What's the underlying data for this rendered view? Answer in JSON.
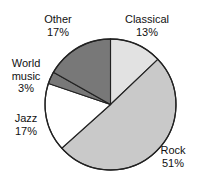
{
  "chart_data": {
    "type": "pie",
    "title": "",
    "subtitle": "",
    "xlabel": "",
    "ylabel": "",
    "legend_position": "none",
    "grid": false,
    "start_angle_deg": 0,
    "direction": "clockwise",
    "categories": [
      "Classical",
      "Rock",
      "Jazz",
      "World music",
      "Other"
    ],
    "values": [
      13,
      51,
      17,
      3,
      17
    ],
    "unit": "%",
    "colors": [
      "#e2e2e2",
      "#c9c9c9",
      "#ffffff",
      "#787878",
      "#787878"
    ],
    "outline_color": "#222222",
    "slices": [
      {
        "label": "Classical",
        "value": 13,
        "value_text": "13%",
        "color": "#e2e2e2"
      },
      {
        "label": "Rock",
        "value": 51,
        "value_text": "51%",
        "color": "#c9c9c9"
      },
      {
        "label": "Jazz",
        "value": 17,
        "value_text": "17%",
        "color": "#ffffff"
      },
      {
        "label": "World music",
        "value": 3,
        "value_text": "3%",
        "color": "#787878"
      },
      {
        "label": "Other",
        "value": 17,
        "value_text": "17%",
        "color": "#787878"
      }
    ]
  },
  "labels": {
    "classical": {
      "name": "Classical",
      "value_text": "13%"
    },
    "rock": {
      "name": "Rock",
      "value_text": "51%"
    },
    "jazz": {
      "name": "Jazz",
      "value_text": "17%"
    },
    "world_line1": "World",
    "world_line2": "music",
    "world_value_text": "3%",
    "other": {
      "name": "Other",
      "value_text": "17%"
    }
  }
}
